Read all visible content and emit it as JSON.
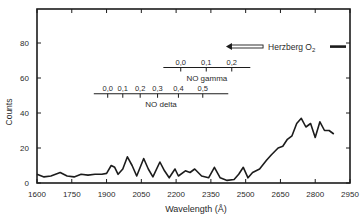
{
  "chart_data": {
    "type": "line",
    "title": "",
    "xlabel": "Wavelength (Å)",
    "ylabel": "Counts",
    "xlim": [
      1600,
      2950
    ],
    "ylim": [
      0,
      99
    ],
    "x_ticks": [
      1600,
      1750,
      1900,
      2050,
      2200,
      2350,
      2500,
      2650,
      2800,
      2950
    ],
    "y_ticks": [
      0,
      20,
      40,
      60,
      80
    ],
    "grid": false,
    "legend": null,
    "series": [
      {
        "name": "spectrum",
        "x": [
          1600,
          1630,
          1660,
          1700,
          1730,
          1760,
          1790,
          1820,
          1850,
          1880,
          1900,
          1920,
          1935,
          1950,
          1970,
          1990,
          2010,
          2030,
          2060,
          2080,
          2100,
          2130,
          2150,
          2170,
          2195,
          2210,
          2240,
          2260,
          2280,
          2310,
          2340,
          2365,
          2390,
          2420,
          2450,
          2470,
          2490,
          2510,
          2530,
          2560,
          2590,
          2610,
          2640,
          2660,
          2680,
          2700,
          2720,
          2740,
          2760,
          2780,
          2800,
          2820,
          2840,
          2860,
          2880
        ],
        "values": [
          5,
          3.5,
          4,
          6,
          4,
          3.5,
          5,
          4.5,
          5,
          5,
          5.5,
          10,
          9,
          5,
          8,
          15,
          10,
          4,
          14,
          8,
          3.5,
          12,
          7,
          3,
          8,
          4,
          7,
          6,
          8,
          4,
          3,
          9,
          3,
          1.5,
          2,
          5,
          9,
          3,
          6,
          8,
          13,
          16,
          20,
          21,
          25,
          27,
          34,
          37,
          32,
          34,
          26,
          35,
          30,
          30,
          28
        ]
      }
    ],
    "annotations": [
      {
        "label": "NO gamma",
        "y_level": 66,
        "span": [
          2145,
          2520
        ],
        "ticks": [
          {
            "label": "0,0",
            "x": 2220
          },
          {
            "label": "0,1",
            "x": 2330
          },
          {
            "label": "0,2",
            "x": 2440
          }
        ]
      },
      {
        "label": "NO delta",
        "y_level": 51,
        "span": [
          1845,
          2425
        ],
        "ticks": [
          {
            "label": "0,0",
            "x": 1905
          },
          {
            "label": "0,1",
            "x": 1970
          },
          {
            "label": "0,2",
            "x": 2045
          },
          {
            "label": "0,3",
            "x": 2120
          },
          {
            "label": "0,4",
            "x": 2210
          },
          {
            "label": "0,5",
            "x": 2315
          }
        ]
      },
      {
        "label": "Herzberg O",
        "subscript": "2",
        "y_level": 78,
        "arrow_from": 2575,
        "arrow_to": 2415,
        "bar_span": [
          2940,
          3010
        ]
      }
    ]
  }
}
